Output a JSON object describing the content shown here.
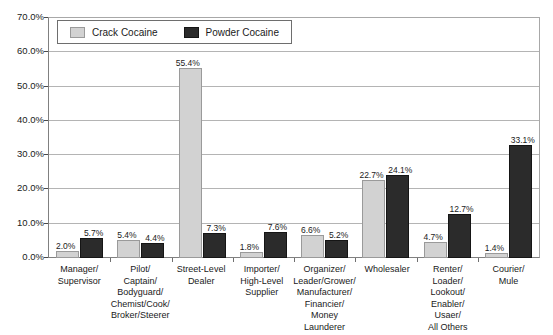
{
  "chart_data": {
    "type": "bar",
    "title": "",
    "subtitle": "",
    "xlabel": "",
    "ylabel": "",
    "ylim": [
      0,
      70
    ],
    "grid": true,
    "legend_position": "top-left",
    "ytick_labels": [
      "70.0%",
      "60.0%",
      "50.0%",
      "40.0%",
      "30.0%",
      "20.0%",
      "10.0%",
      "0.0%"
    ],
    "ytick_values": [
      70,
      60,
      50,
      40,
      30,
      20,
      10,
      0
    ],
    "categories": [
      "Manager/\nSupervisor",
      "Pilot/\nCaptain/\nBodyguard/\nChemist/Cook/\nBroker/Steerer",
      "Street-Level\nDealer",
      "Importer/\nHigh-Level\nSupplier",
      "Organizer/\nLeader/Grower/\nManufacturer/\nFinancier/\nMoney Launderer",
      "Wholesaler",
      "Renter/\nLoader/\nLookout/\nEnabler/\nUsaer/\nAll Others",
      "Courier/\nMule"
    ],
    "series": [
      {
        "name": "Crack Cocaine",
        "color": "#d2d2d2",
        "values": [
          2.0,
          5.4,
          55.4,
          1.8,
          6.6,
          22.7,
          4.7,
          1.4
        ],
        "labels": [
          "2.0%",
          "5.4%",
          "55.4%",
          "1.8%",
          "6.6%",
          "22.7%",
          "4.7%",
          "1.4%"
        ]
      },
      {
        "name": "Powder Cocaine",
        "color": "#2b2b2b",
        "values": [
          5.7,
          4.4,
          7.3,
          7.6,
          5.2,
          24.1,
          12.7,
          33.1
        ],
        "labels": [
          "5.7%",
          "4.4%",
          "7.3%",
          "7.6%",
          "5.2%",
          "24.1%",
          "12.7%",
          "33.1%"
        ]
      }
    ]
  },
  "legend": {
    "items": [
      {
        "label": "Crack Cocaine",
        "swatch": "crack"
      },
      {
        "label": "Powder Cocaine",
        "swatch": "powder"
      }
    ]
  }
}
